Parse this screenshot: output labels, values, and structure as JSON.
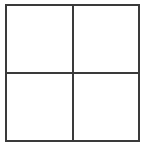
{
  "diagram": {
    "type": "2x2 grid",
    "rows": 2,
    "columns": 2,
    "line_color": "#3a3a3a",
    "background": "#ffffff",
    "cells": [
      {
        "label": ""
      },
      {
        "label": ""
      },
      {
        "label": ""
      },
      {
        "label": ""
      }
    ]
  }
}
